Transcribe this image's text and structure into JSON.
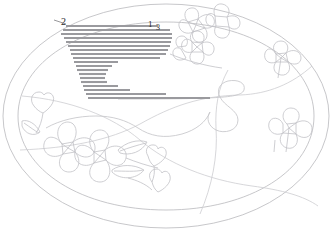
{
  "figure": {
    "kind": "line-art-drawing",
    "background_color": "#ffffff",
    "outline_color": "#b9b9bd",
    "hatch_color": "#9a9a9e",
    "label_color": "#2b2b2b",
    "reference_labels": [
      {
        "id": "lbl2",
        "text": "2",
        "x": 61,
        "y": 17,
        "font_size": 10
      },
      {
        "id": "lbl1",
        "text": "1",
        "x": 148,
        "y": 20,
        "font_size": 9
      },
      {
        "id": "lbl3",
        "text": "3",
        "x": 156,
        "y": 24,
        "font_size": 8
      }
    ],
    "hatch_lines": [
      {
        "x1": 66,
        "x2": 158,
        "y": 26
      },
      {
        "x1": 63,
        "x2": 170,
        "y": 30
      },
      {
        "x1": 61,
        "x2": 172,
        "y": 34
      },
      {
        "x1": 64,
        "x2": 172,
        "y": 38
      },
      {
        "x1": 66,
        "x2": 171,
        "y": 42
      },
      {
        "x1": 68,
        "x2": 170,
        "y": 46
      },
      {
        "x1": 70,
        "x2": 168,
        "y": 50
      },
      {
        "x1": 71,
        "x2": 166,
        "y": 54
      },
      {
        "x1": 73,
        "x2": 160,
        "y": 58
      },
      {
        "x1": 74,
        "x2": 118,
        "y": 62
      },
      {
        "x1": 76,
        "x2": 112,
        "y": 66
      },
      {
        "x1": 77,
        "x2": 108,
        "y": 70
      },
      {
        "x1": 79,
        "x2": 106,
        "y": 74
      },
      {
        "x1": 80,
        "x2": 105,
        "y": 78
      },
      {
        "x1": 81,
        "x2": 107,
        "y": 82
      },
      {
        "x1": 83,
        "x2": 118,
        "y": 86
      },
      {
        "x1": 84,
        "x2": 130,
        "y": 90
      },
      {
        "x1": 86,
        "x2": 166,
        "y": 94
      },
      {
        "x1": 88,
        "x2": 210,
        "y": 98
      }
    ]
  }
}
